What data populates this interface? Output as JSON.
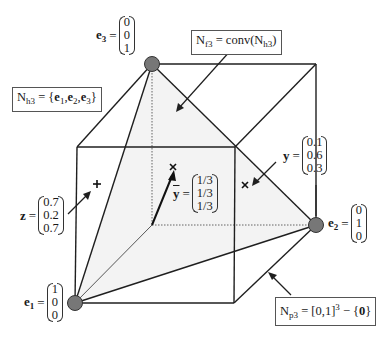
{
  "diagram": {
    "type": "unit-cube-simplex",
    "vertices": {
      "e1": {
        "name": "e",
        "sub": "1",
        "components": [
          "1",
          "0",
          "0"
        ]
      },
      "e2": {
        "name": "e",
        "sub": "2",
        "components": [
          "0",
          "1",
          "0"
        ]
      },
      "e3": {
        "name": "e",
        "sub": "3",
        "components": [
          "0",
          "0",
          "1"
        ]
      }
    },
    "points": {
      "y_bar": {
        "name": "y",
        "overline": true,
        "components": [
          "1/3",
          "1/3",
          "1/3"
        ],
        "marker": "×"
      },
      "y": {
        "name": "y",
        "components": [
          "0.1",
          "0.6",
          "0.3"
        ],
        "marker": "×"
      },
      "z": {
        "name": "z",
        "components": [
          "0.7",
          "0.2",
          "0.7"
        ],
        "marker": "+"
      }
    },
    "labels": {
      "nh3": {
        "lhs": "N",
        "lhs_sub": "h3",
        "eq": " = ",
        "rhs": "{e1, e2, e3}",
        "rhs_parts": [
          "{",
          "e",
          "1",
          ",",
          "e",
          "2",
          ",",
          "e",
          "3",
          "}"
        ]
      },
      "nf3": {
        "lhs": "N",
        "lhs_sub": "f3",
        "eq": " = ",
        "rhs_prefix": "conv(",
        "rhs_inner": "N",
        "rhs_inner_sub": "h3",
        "rhs_suffix": ")"
      },
      "np3": {
        "lhs": "N",
        "lhs_sub": "p3",
        "eq": " = ",
        "rhs_prefix": "[0,1]",
        "rhs_sup": "3",
        "rhs_minus": " − {",
        "rhs_zero": "0",
        "rhs_suffix": "}"
      }
    },
    "eq_sign": "=",
    "colors": {
      "line": "#1f1f1f",
      "vertex_fill": "#777777",
      "simplex_fill": "#f2f2f2",
      "box_border": "#555555"
    }
  }
}
